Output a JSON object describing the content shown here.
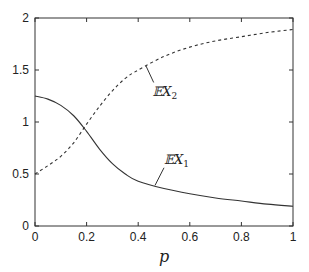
{
  "chart_data": {
    "type": "line",
    "title": "",
    "xlabel": "p",
    "ylabel": "",
    "xlim": [
      0,
      1
    ],
    "ylim": [
      0,
      2
    ],
    "grid": false,
    "legend": "inline annotations",
    "x_ticks": [
      "0",
      "0.2",
      "0.4",
      "0.6",
      "0.8",
      "1"
    ],
    "y_ticks": [
      "0",
      "0.5",
      "1",
      "1.5",
      "2"
    ],
    "x": [
      0,
      0.05,
      0.1,
      0.15,
      0.2,
      0.25,
      0.3,
      0.35,
      0.4,
      0.5,
      0.6,
      0.7,
      0.8,
      0.9,
      1.0
    ],
    "series": [
      {
        "name": "EX1",
        "label_main": "𝔼X",
        "label_sub": "1",
        "style": "solid",
        "values": [
          1.25,
          1.22,
          1.16,
          1.06,
          0.91,
          0.74,
          0.6,
          0.5,
          0.43,
          0.36,
          0.31,
          0.27,
          0.24,
          0.21,
          0.19
        ]
      },
      {
        "name": "EX2",
        "label_main": "𝔼X",
        "label_sub": "2",
        "style": "dashed",
        "values": [
          0.5,
          0.58,
          0.67,
          0.8,
          0.98,
          1.15,
          1.3,
          1.42,
          1.5,
          1.63,
          1.72,
          1.78,
          1.82,
          1.86,
          1.89
        ]
      }
    ]
  }
}
